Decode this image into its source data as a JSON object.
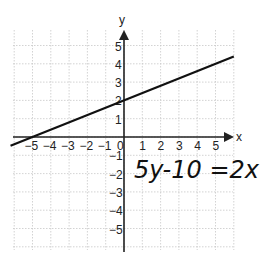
{
  "chart_data": {
    "type": "line",
    "title": "",
    "xlabel": "x",
    "ylabel": "y",
    "xlim": [
      -6,
      6
    ],
    "ylim": [
      -6,
      6
    ],
    "grid": true,
    "x_ticks": [
      "-5",
      "-4",
      "-3",
      "-2",
      "-1",
      "0",
      "1",
      "2",
      "3",
      "4",
      "5"
    ],
    "y_ticks": [
      "5",
      "4",
      "3",
      "2",
      "1",
      "-1",
      "-2",
      "-3",
      "-4",
      "-5"
    ],
    "series": [
      {
        "name": "5y-10=2x",
        "equation": "y = 0.4x + 2",
        "x": [
          -6.2,
          6.0
        ],
        "y": [
          -0.48,
          4.4
        ],
        "points": [
          {
            "x": -5,
            "y": 0
          },
          {
            "x": 0,
            "y": 2
          }
        ]
      }
    ],
    "annotations": [
      {
        "text": "5y-10 =2x",
        "position": "lower-right quadrant, handwritten"
      }
    ]
  },
  "labels": {
    "x_axis": "x",
    "y_axis": "y",
    "equation": "5y-10 =2x"
  }
}
